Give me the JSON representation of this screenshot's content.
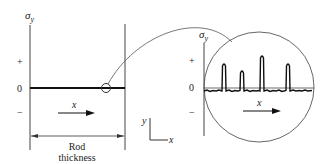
{
  "left_panel": {
    "y_axis_label": "σ",
    "y_axis_sub": "y",
    "tick_plus": "+",
    "tick_zero": "0",
    "tick_minus": "−",
    "x_arrow_label": "x",
    "dimension_label_line1": "Rod",
    "dimension_label_line2": "thickness"
  },
  "coordinate_axes": {
    "y_label": "y",
    "x_label": "x"
  },
  "magnified_panel": {
    "y_axis_label": "σ",
    "y_axis_sub": "y",
    "tick_plus": "+",
    "tick_zero": "0",
    "tick_minus": "−",
    "x_arrow_label": "x",
    "peaks_x": [
      224,
      242,
      262,
      288
    ],
    "peaks_top_y": [
      64,
      71,
      56,
      64
    ]
  },
  "colors": {
    "line": "#222222",
    "thin_line": "#555555"
  }
}
